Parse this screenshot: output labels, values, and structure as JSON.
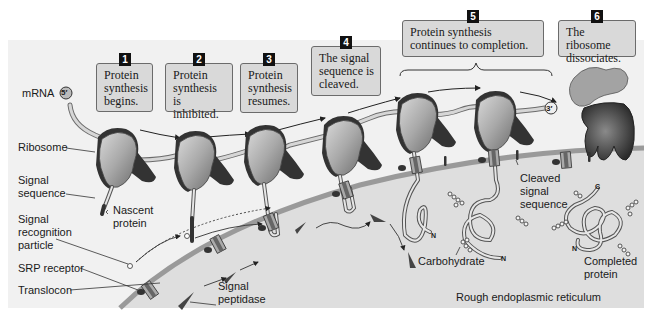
{
  "figure": {
    "colors": {
      "background": "#f2f2f2",
      "lumen": "#dcdcdc",
      "membrane": "#9a9a9a",
      "step_box": "#d9d9d9",
      "ribosome_small": "#a8a8a8",
      "ribosome_large": "#3a3a3a",
      "badge": "#111111"
    }
  },
  "steps": [
    {
      "number": "1",
      "text": "Protein synthesis begins."
    },
    {
      "number": "2",
      "text": "Protein synthesis is inhibited."
    },
    {
      "number": "3",
      "text": "Protein synthesis resumes."
    },
    {
      "number": "4",
      "text": "The signal sequence is cleaved."
    },
    {
      "number": "5",
      "text": "Protein synthesis continues to completion."
    },
    {
      "number": "6",
      "text": "The ribosome dissociates."
    }
  ],
  "labels": {
    "mrna": "mRNA",
    "five_prime": "5′",
    "three_prime": "3′",
    "ribosome": "Ribosome",
    "signal_sequence_1": "Signal",
    "signal_sequence_2": "sequence",
    "nascent_1": "Nascent",
    "nascent_2": "protein",
    "srp_1": "Signal",
    "srp_2": "recognition",
    "srp_3": "particle",
    "srp_receptor": "SRP receptor",
    "translocon": "Translocon",
    "peptidase_1": "Signal",
    "peptidase_2": "peptidase",
    "cleaved_1": "Cleaved",
    "cleaved_2": "signal",
    "cleaved_3": "sequence",
    "carbohydrate": "Carbohydrate",
    "completed_1": "Completed",
    "completed_2": "protein",
    "rough_er": "Rough endoplasmic reticulum",
    "n_terminus": "N",
    "c_terminus": "C"
  }
}
